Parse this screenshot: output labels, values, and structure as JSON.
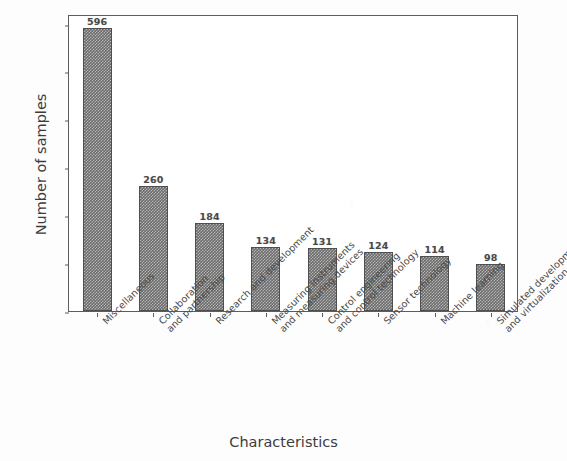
{
  "chart_data": {
    "type": "bar",
    "title": "",
    "xlabel": "Characteristics",
    "ylabel": "Number of samples",
    "ylim": [
      0,
      620
    ],
    "yticks": [
      0,
      100,
      200,
      300,
      400,
      500,
      600
    ],
    "grid": false,
    "legend": null,
    "bar_color": "#6b6b6b",
    "bar_pattern": "checkerboard",
    "categories": [
      "Miscellaneous",
      "Collaboration\nand partnership",
      "Research and development",
      "Measuring instruments\nand measuring devices",
      "Control engineering\nand control technology",
      "Sensor technology",
      "Machine learning",
      "Simulated development\nand virtualization"
    ],
    "values": [
      596,
      260,
      184,
      134,
      131,
      124,
      114,
      98
    ],
    "value_labels": [
      "596",
      "260",
      "184",
      "134",
      "131",
      "124",
      "114",
      "98"
    ],
    "ytick_labels": [
      "0",
      "100",
      "200",
      "300",
      "400",
      "500",
      "600"
    ]
  }
}
